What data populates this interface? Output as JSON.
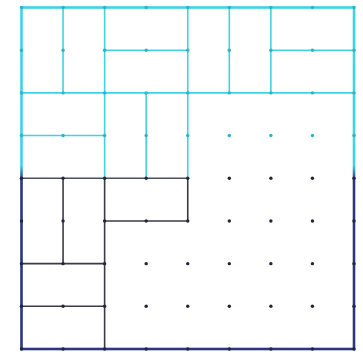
{
  "figure": {
    "label_fragment": ")",
    "grid": {
      "cols": 8,
      "rows": 8,
      "x0": 21.5,
      "x1": 354,
      "y0": 7.5,
      "y1": 349
    },
    "colors": {
      "top": "#3fd3e6",
      "bottom": "#2b3580",
      "inner_bottom": "#3a3a4a",
      "gradient_split_row": 4
    },
    "segments": [
      {
        "from": [
          1,
          0
        ],
        "to": [
          1,
          2
        ]
      },
      {
        "from": [
          2,
          0
        ],
        "to": [
          2,
          2
        ]
      },
      {
        "from": [
          2,
          1
        ],
        "to": [
          4,
          1
        ]
      },
      {
        "from": [
          4,
          0
        ],
        "to": [
          4,
          2
        ]
      },
      {
        "from": [
          5,
          0
        ],
        "to": [
          5,
          2
        ]
      },
      {
        "from": [
          6,
          0
        ],
        "to": [
          6,
          2
        ]
      },
      {
        "from": [
          6,
          1
        ],
        "to": [
          8,
          1
        ]
      },
      {
        "from": [
          0,
          2
        ],
        "to": [
          8,
          2
        ]
      },
      {
        "from": [
          0,
          3
        ],
        "to": [
          2,
          3
        ]
      },
      {
        "from": [
          2,
          2
        ],
        "to": [
          2,
          4
        ]
      },
      {
        "from": [
          3,
          2
        ],
        "to": [
          3,
          4
        ]
      },
      {
        "from": [
          4,
          2
        ],
        "to": [
          4,
          4
        ]
      },
      {
        "from": [
          0,
          4
        ],
        "to": [
          4,
          4
        ]
      },
      {
        "from": [
          1,
          4
        ],
        "to": [
          1,
          6
        ]
      },
      {
        "from": [
          2,
          4
        ],
        "to": [
          2,
          8
        ]
      },
      {
        "from": [
          2,
          5
        ],
        "to": [
          4,
          5
        ]
      },
      {
        "from": [
          4,
          4
        ],
        "to": [
          4,
          5
        ]
      },
      {
        "from": [
          0,
          6
        ],
        "to": [
          2,
          6
        ]
      },
      {
        "from": [
          0,
          7
        ],
        "to": [
          2,
          7
        ]
      }
    ]
  }
}
